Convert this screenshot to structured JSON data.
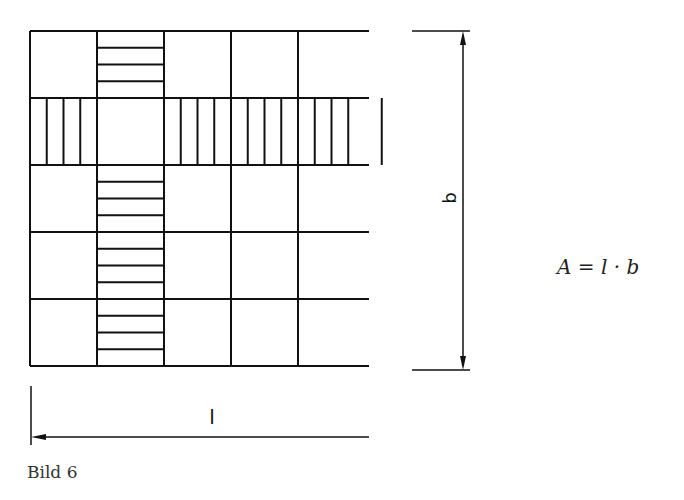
{
  "figure": {
    "caption": "Bild 6",
    "formula": "A = l · b",
    "dimension_width_label": "l",
    "dimension_height_label": "b"
  },
  "grid": {
    "columns": 5,
    "rows": 5,
    "origin": [
      30,
      31
    ],
    "cell_size": 67,
    "striped_column_index": 1,
    "striped_row_index": 1,
    "stripes_per_cell": 4,
    "line_color": "#111111"
  }
}
